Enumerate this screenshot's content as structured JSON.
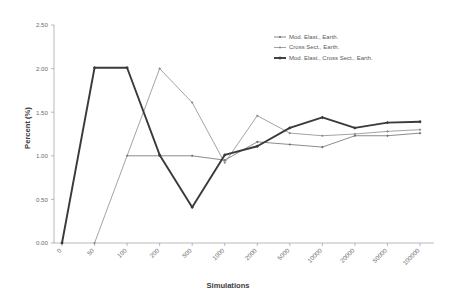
{
  "chart_data": {
    "type": "line",
    "title": "",
    "subtitle": "",
    "xlabel": "Simulations",
    "ylabel": "Percent (%)",
    "categories": [
      "0",
      "50",
      "100",
      "200",
      "500",
      "1000",
      "2000",
      "5000",
      "10000",
      "20000",
      "50000",
      "100000"
    ],
    "ylim": [
      0.0,
      2.5
    ],
    "yticks": [
      "0.00",
      "0.50",
      "1.00",
      "1.50",
      "2.00",
      "2.50"
    ],
    "ytick_values": [
      0.0,
      0.5,
      1.0,
      1.5,
      2.0,
      2.5
    ],
    "grid": false,
    "legend_position": "top-right",
    "marker": "diamond",
    "series": [
      {
        "name": "Mod. Elast., Earth.",
        "color": "#6d6e71",
        "width": 0.8,
        "values": [
          null,
          null,
          1.0,
          1.0,
          1.0,
          0.95,
          1.16,
          1.13,
          1.1,
          1.23,
          1.23,
          1.26
        ]
      },
      {
        "name": "Cross Sect., Earth.",
        "color": "#8a8b8d",
        "width": 0.8,
        "values": [
          null,
          0.0,
          null,
          2.0,
          1.61,
          0.92,
          1.46,
          1.26,
          1.23,
          1.25,
          1.28,
          1.3
        ]
      },
      {
        "name": "Mod. Elast., Cross Sect., Earth.",
        "color": "#3a3a3c",
        "width": 1.9,
        "values": [
          0.0,
          2.01,
          2.01,
          1.01,
          0.41,
          1.01,
          1.11,
          1.32,
          1.44,
          1.32,
          1.38,
          1.39
        ]
      }
    ]
  },
  "legend": {
    "entries": [
      {
        "label": "Mod. Elast., Earth."
      },
      {
        "label": "Cross Sect., Earth."
      },
      {
        "label": "Mod. Elast., Cross Sect., Earth."
      }
    ]
  },
  "axes": {
    "x_title": "Simulations",
    "y_title": "Percent (%)"
  }
}
